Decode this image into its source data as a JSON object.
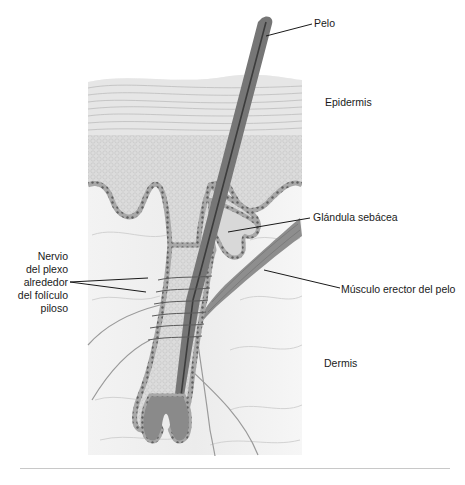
{
  "figure": {
    "labels": {
      "pelo": "Pelo",
      "epidermis": "Epidermis",
      "glandula": "Glándula sebácea",
      "musculo": "Músculo erector del pelo",
      "dermis": "Dermis",
      "nervio": [
        "Nervio",
        "del plexo",
        "alrededor",
        "del folículo",
        "piloso"
      ]
    },
    "colors": {
      "background": "#ffffff",
      "epidermis_fill": "#e4e4e4",
      "epidermis_lines": "#bdbdbd",
      "basal_layer": "#d6d6d6",
      "cell_border": "#8a8a8a",
      "dermis_fill": "#efefef",
      "hair_shaft": "#6e6e6e",
      "hair_core": "#3c3c3c",
      "muscle": "#8c8c8c",
      "nerve": "#9a9a9a",
      "leader_line": "#1a1a1a",
      "divider": "#c8c8c8"
    }
  }
}
